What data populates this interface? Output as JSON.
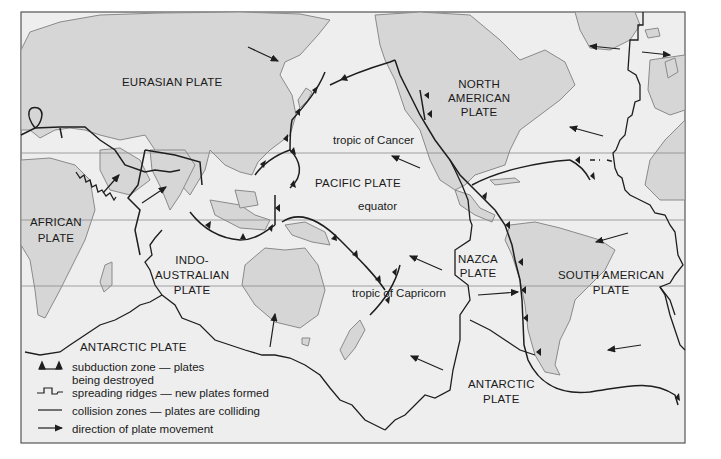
{
  "map": {
    "title": "",
    "colors": {
      "land": "#d6d6d6",
      "ocean": "#eeeeee",
      "line": "#1e1e1e",
      "coast": "#8a8a8a",
      "frame": "#555555"
    },
    "plates": [
      {
        "id": "eurasian",
        "label": "EURASIAN PLATE"
      },
      {
        "id": "north-american",
        "label": "NORTH\nAMERICAN\nPLATE"
      },
      {
        "id": "pacific",
        "label": "PACIFIC PLATE"
      },
      {
        "id": "african",
        "label": "AFRICAN\nPLATE"
      },
      {
        "id": "indo-australian",
        "label": "INDO-\nAUSTRALIAN\nPLATE"
      },
      {
        "id": "nazca",
        "label": "NAZCA\nPLATE"
      },
      {
        "id": "south-american",
        "label": "SOUTH AMERICAN\nPLATE"
      },
      {
        "id": "antarctic-west",
        "label": "ANTARCTIC PLATE"
      },
      {
        "id": "antarctic-east",
        "label": "ANTARCTIC\nPLATE"
      }
    ],
    "latitudes": {
      "cancer": "tropic of Cancer",
      "equator": "equator",
      "capricorn": "tropic of Capricorn"
    },
    "legend": [
      {
        "symbol": "subduction",
        "text": "subduction zone — plates",
        "text2": "being destroyed"
      },
      {
        "symbol": "spreading",
        "text": "spreading ridges — new plates formed"
      },
      {
        "symbol": "collision",
        "text": "collision zones — plates are colliding"
      },
      {
        "symbol": "arrow",
        "text": "direction of plate movement"
      }
    ]
  }
}
